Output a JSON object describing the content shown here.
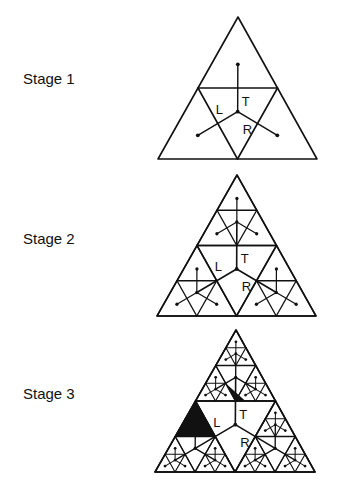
{
  "stages": [
    {
      "label": "Stage 1",
      "level": 1,
      "label_pos": [
        23,
        83
      ],
      "apex": [
        238,
        17
      ],
      "base_left": [
        158,
        159
      ],
      "base_right": [
        317,
        159
      ],
      "center_labels": {
        "top": "T",
        "left": "L",
        "right": "R"
      }
    },
    {
      "label": "Stage 2",
      "level": 2,
      "label_pos": [
        23,
        243
      ],
      "apex": [
        237,
        175
      ],
      "base_left": [
        157,
        316
      ],
      "base_right": [
        316,
        316
      ],
      "center_labels": {
        "top": "T",
        "left": "L",
        "right": "R"
      }
    },
    {
      "label": "Stage 3",
      "level": 3,
      "label_pos": [
        23,
        398
      ],
      "apex": [
        236,
        330
      ],
      "base_left": [
        155,
        472
      ],
      "base_right": [
        315,
        472
      ],
      "center_labels": {
        "top": "T",
        "left": "L",
        "right": "R"
      },
      "filled_triangles": 3
    }
  ],
  "colors": {
    "stroke": "#111111",
    "fill": "#111111",
    "background": "#ffffff"
  }
}
